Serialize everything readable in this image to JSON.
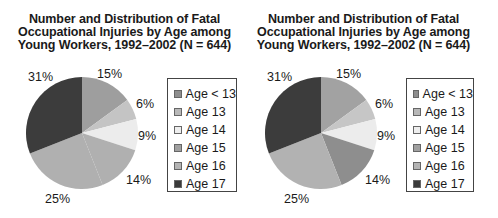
{
  "chart_data": [
    {
      "type": "pie",
      "title": "Number and Distribution of Fatal Occupational Injuries by Age among Young Workers, 1992–2002 (N = 644)",
      "title_lines": [
        "Number and Distribution of Fatal",
        "Occupational Injuries by Age among",
        "Young Workers, 1992–2002 (N = 644)"
      ],
      "categories": [
        "Age < 13",
        "Age 13",
        "Age 14",
        "Age 15",
        "Age 16",
        "Age 17"
      ],
      "values": [
        15,
        6,
        9,
        14,
        25,
        31
      ],
      "labels": [
        "15%",
        "6%",
        "9%",
        "14%",
        "25%",
        "31%"
      ],
      "colors": [
        "#9e9e9e",
        "#c4c4c4",
        "#ececec",
        "#b0b0b0",
        "#b0b0b0",
        "#3c3c3c"
      ],
      "legend_colors": [
        "#8e8e8e",
        "#b8b8b8",
        "#eeeeee",
        "#a0a0a0",
        "#b4b4b4",
        "#3a3a3a"
      ],
      "legend_position": "right"
    },
    {
      "type": "pie",
      "title": "Number and Distribution of Fatal Occupational Injuries by Age among Young Workers, 1992–2002 (N = 644)",
      "title_lines": [
        "Number and Distribution of Fatal",
        "Occupational Injuries by Age among",
        "Young Workers, 1992–2002 (N = 644)"
      ],
      "categories": [
        "Age < 13",
        "Age 13",
        "Age 14",
        "Age 15",
        "Age 16",
        "Age 17"
      ],
      "values": [
        15,
        6,
        9,
        14,
        25,
        31
      ],
      "labels": [
        "15%",
        "6%",
        "9%",
        "14%",
        "25%",
        "31%"
      ],
      "colors": [
        "#a2a2a2",
        "#c6c6c6",
        "#ececec",
        "#8e8e8e",
        "#b2b2b2",
        "#3c3c3c"
      ],
      "legend_colors": [
        "#8e8e8e",
        "#b8b8b8",
        "#eeeeee",
        "#a0a0a0",
        "#b4b4b4",
        "#3a3a3a"
      ],
      "legend_position": "right"
    }
  ]
}
